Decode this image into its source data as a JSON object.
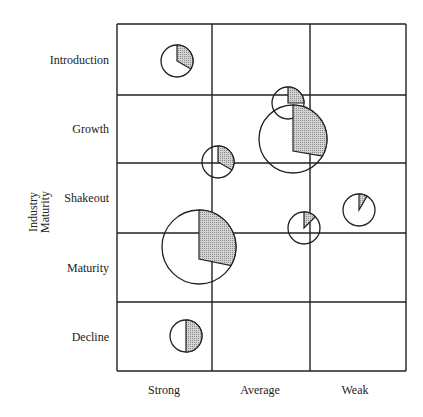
{
  "diagram": {
    "type": "portfolio-matrix",
    "y_axis_title": [
      "Industry",
      "Maturity"
    ],
    "rows": [
      "Introduction",
      "Growth",
      "Shakeout",
      "Maturity",
      "Decline"
    ],
    "columns": [
      "Strong",
      "Average",
      "Weak"
    ],
    "grid": {
      "left": 117,
      "right": 406,
      "top": 24,
      "bottom": 371,
      "col_lines": [
        117,
        212,
        310,
        406
      ],
      "row_lines": [
        24,
        95,
        163,
        233,
        302,
        371
      ]
    },
    "colors": {
      "line": "#222222",
      "fill": "#b8b8b8",
      "background": "#ffffff"
    },
    "bubbles": [
      {
        "cx": 177,
        "cy": 61,
        "r": 16,
        "share_start": 0,
        "share_end": 120,
        "label": "Introduction/Strong"
      },
      {
        "cx": 288,
        "cy": 103,
        "r": 16,
        "share_start": 0,
        "share_end": 90,
        "label": "Growth/Average small",
        "offset_square": true
      },
      {
        "cx": 293,
        "cy": 139,
        "r": 34,
        "share_start": 0,
        "share_end": 120,
        "label": "Growth/Average large",
        "offset": 12
      },
      {
        "cx": 218,
        "cy": 162,
        "r": 16,
        "share_start": 0,
        "share_end": 120,
        "label": "Growth-Shakeout/Average"
      },
      {
        "cx": 359,
        "cy": 210,
        "r": 16,
        "share_start": 0,
        "share_end": 30,
        "label": "Shakeout/Weak"
      },
      {
        "cx": 304,
        "cy": 228,
        "r": 16,
        "share_start": 0,
        "share_end": 45,
        "label": "Shakeout/Average"
      },
      {
        "cx": 199,
        "cy": 247,
        "r": 37,
        "share_start": 0,
        "share_end": 120,
        "label": "Maturity/Strong",
        "offset": 12
      },
      {
        "cx": 186,
        "cy": 336,
        "r": 16,
        "share_start": 0,
        "share_end": 180,
        "label": "Decline/Strong"
      }
    ]
  }
}
